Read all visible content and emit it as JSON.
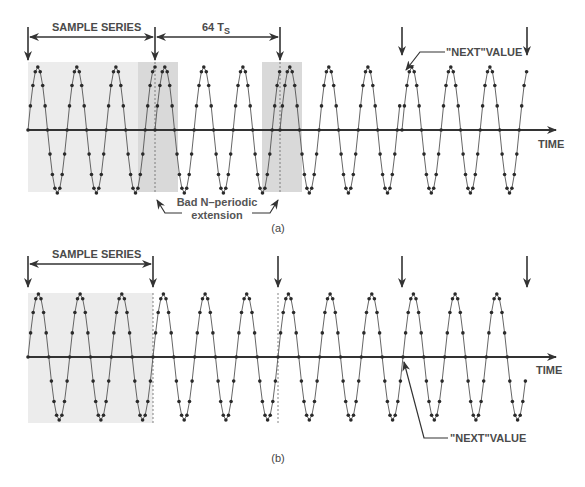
{
  "panel_a": {
    "caption": "(a)",
    "sample_series_label": "SAMPLE SERIES",
    "period_label": "64 T",
    "period_label_sub": "S",
    "next_value_label": "\"NEXT\"VALUE",
    "time_label": "TIME",
    "bad_extension_label_line1": "Bad N–periodic",
    "bad_extension_label_line2": "extension"
  },
  "panel_b": {
    "caption": "(b)",
    "sample_series_label": "SAMPLE SERIES",
    "next_value_label": "\"NEXT\"VALUE",
    "time_label": "TIME"
  },
  "colors": {
    "ink": "#333333",
    "shade_light": "#ebebeb",
    "shade_dark": "#d6d6d6",
    "text": "#4a4a4a"
  }
}
